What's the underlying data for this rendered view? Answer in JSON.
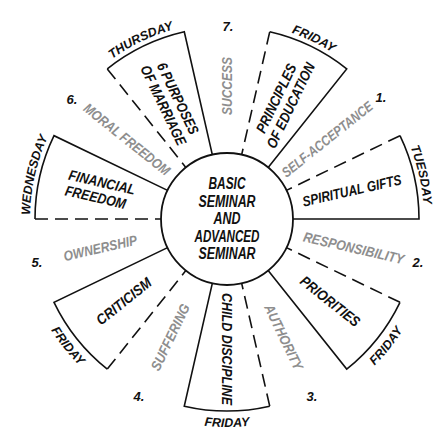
{
  "center_label": {
    "lines": [
      "BASIC",
      "SEMINAR",
      "AND",
      "ADVANCED",
      "SEMINAR"
    ]
  },
  "topics": [
    {
      "lines": [
        "SPIRITUAL GIFTS"
      ],
      "day": "TUESDAY"
    },
    {
      "lines": [
        "PRIORITIES"
      ],
      "day": "FRIDAY"
    },
    {
      "lines": [
        "CHILD DISCIPLINE"
      ],
      "day": "FRIDAY"
    },
    {
      "lines": [
        "CRITICISM"
      ],
      "day": "FRIDAY"
    },
    {
      "lines": [
        "FINANCIAL",
        "FREEDOM"
      ],
      "day": "WEDNESDAY"
    },
    {
      "lines": [
        "6 PURPOSES",
        "OF MARRIAGE"
      ],
      "day": "THURSDAY"
    },
    {
      "lines": [
        "PRINCIPLES",
        "OF EDUCATION"
      ],
      "day": "FRIDAY"
    }
  ],
  "principles": [
    {
      "number": "1.",
      "label": "SELF-ACCEPTANCE"
    },
    {
      "number": "2.",
      "label": "RESPONSIBILITY"
    },
    {
      "number": "3.",
      "label": "AUTHORITY"
    },
    {
      "number": "4.",
      "label": "SUFFERING"
    },
    {
      "number": "5.",
      "label": "OWNERSHIP"
    },
    {
      "number": "6.",
      "label": "MORAL FREEDOM"
    },
    {
      "number": "7.",
      "label": "SUCCESS"
    }
  ],
  "colors": {
    "ink": "#111111",
    "principle_text": "#8e8e8e",
    "background": "#ffffff"
  }
}
